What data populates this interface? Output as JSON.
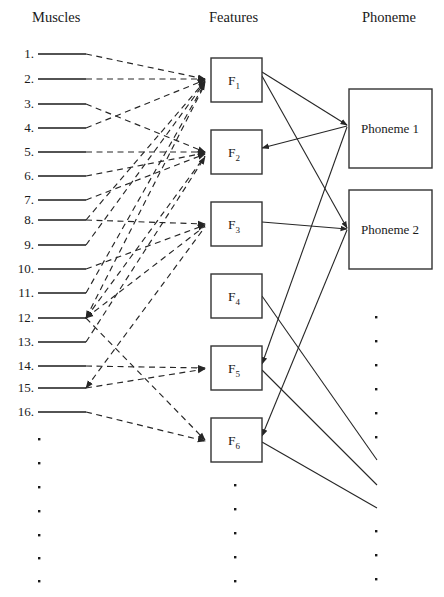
{
  "diagram": {
    "columns": {
      "muscles_header": "Muscles",
      "features_header": "Features",
      "phoneme_header": "Phoneme"
    },
    "colors": {
      "stroke": "#262626",
      "box_stroke": "#333333",
      "text": "#1a1a1a",
      "background": "#ffffff"
    },
    "muscles": {
      "labels": [
        "1.",
        "2.",
        "3.",
        "4.",
        "5.",
        "6.",
        "7.",
        "8.",
        "9.",
        "10.",
        "11.",
        "12.",
        "13.",
        "14.",
        "15.",
        "16."
      ],
      "count": 16,
      "ellipsis_dots": 7,
      "line_style": "solid-short-rule"
    },
    "features": {
      "boxes": [
        {
          "label": "F",
          "subscript": "1"
        },
        {
          "label": "F",
          "subscript": "2"
        },
        {
          "label": "F",
          "subscript": "3"
        },
        {
          "label": "F",
          "subscript": "4"
        },
        {
          "label": "F",
          "subscript": "5"
        },
        {
          "label": "F",
          "subscript": "6"
        }
      ],
      "count": 6,
      "ellipsis_dots": 5
    },
    "phonemes": {
      "boxes": [
        {
          "label": "Phoneme 1"
        },
        {
          "label": "Phoneme 2"
        }
      ],
      "count": 2,
      "ellipsis_dots": 9
    },
    "edges": {
      "muscle_to_feature_style": "dashed-with-arrowheads",
      "feature_to_phoneme_style": "solid-with-arrowheads",
      "muscle_to_feature": [
        {
          "from": 1,
          "to": 1
        },
        {
          "from": 2,
          "to": 1
        },
        {
          "from": 3,
          "to": 2
        },
        {
          "from": 4,
          "to": 1
        },
        {
          "from": 5,
          "to": 2
        },
        {
          "from": 6,
          "to": 2
        },
        {
          "from": 7,
          "to": 2
        },
        {
          "from": 8,
          "to": 3
        },
        {
          "from": 8,
          "to": 1
        },
        {
          "from": 9,
          "to": 1
        },
        {
          "from": 10,
          "to": 3
        },
        {
          "from": 11,
          "to": 1
        },
        {
          "from": 12,
          "to": 1
        },
        {
          "from": 12,
          "to": 2
        },
        {
          "from": 12,
          "to": 3
        },
        {
          "from": 12,
          "to": 6
        },
        {
          "from": 13,
          "to": 2
        },
        {
          "from": 14,
          "to": 5
        },
        {
          "from": 15,
          "to": 3
        },
        {
          "from": 15,
          "to": 5
        },
        {
          "from": 16,
          "to": 6
        }
      ],
      "feature_to_phoneme": [
        {
          "from": 1,
          "to": "Phoneme 1"
        },
        {
          "from": 1,
          "to": "Phoneme 2"
        },
        {
          "from": 2,
          "to": "Phoneme 1"
        },
        {
          "from": 3,
          "to": "Phoneme 2"
        },
        {
          "from": 5,
          "to": "Phoneme 1"
        },
        {
          "from": 6,
          "to": "Phoneme 1"
        },
        {
          "from": 4,
          "to": "ellipsis"
        },
        {
          "from": 5,
          "to": "ellipsis"
        },
        {
          "from": 6,
          "to": "ellipsis"
        }
      ]
    }
  }
}
